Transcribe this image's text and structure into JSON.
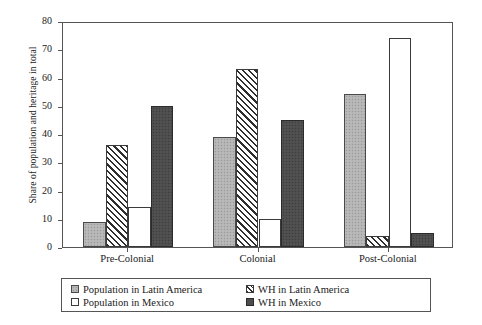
{
  "chart_data": {
    "type": "bar",
    "title": "",
    "xlabel": "",
    "ylabel": "Share of population and heritage in total",
    "ylim": [
      0,
      80
    ],
    "yticks": [
      0,
      10,
      20,
      30,
      40,
      50,
      60,
      70,
      80
    ],
    "grid": false,
    "legend_position": "bottom",
    "categories": [
      "Pre-Colonial",
      "Colonial",
      "Post-Colonial"
    ],
    "series": [
      {
        "name": "Population in Latin America",
        "key": "pop-latam",
        "style": "light-gray-stippled",
        "color": "#b3b3b3",
        "values": [
          9,
          39,
          54
        ]
      },
      {
        "name": "WH in Latin America",
        "key": "wh-latam",
        "style": "diagonal-hatch",
        "color": "#2e2e2e",
        "values": [
          36,
          63,
          4
        ]
      },
      {
        "name": "Population in Mexico",
        "key": "pop-mex",
        "style": "white-outline",
        "color": "#ffffff",
        "values": [
          14,
          10,
          74
        ]
      },
      {
        "name": "WH in Mexico",
        "key": "wh-mex",
        "style": "dark-gray",
        "color": "#4d4d4d",
        "values": [
          50,
          45,
          5
        ]
      }
    ]
  },
  "legend": {
    "entries": [
      {
        "label": "Population in Latin America",
        "swatch": "pop-latam"
      },
      {
        "label": "Population in Mexico",
        "swatch": "pop-mex"
      },
      {
        "label": "WH in Latin America",
        "swatch": "wh-latam"
      },
      {
        "label": "WH in Mexico",
        "swatch": "wh-mex"
      }
    ]
  }
}
